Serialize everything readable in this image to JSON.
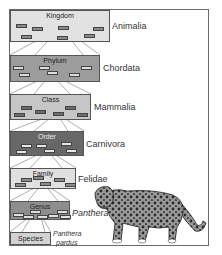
{
  "diagram": {
    "levels": [
      {
        "rank": "Kingdom",
        "taxon": "Animalia",
        "fill": "#e2e2e2",
        "chip": "#8a8a8a"
      },
      {
        "rank": "Phylum",
        "taxon": "Chordata",
        "fill": "#9c9c9c",
        "chip": "#dcdcdc"
      },
      {
        "rank": "Class",
        "taxon": "Mammalia",
        "fill": "#c6c6c6",
        "chip": "#6c6c6c"
      },
      {
        "rank": "Order",
        "taxon": "Carnivora",
        "fill": "#686868",
        "chip": "#e6e6e6"
      },
      {
        "rank": "Family",
        "taxon": "Felidae",
        "fill": "#e0e0e0",
        "chip": "#8c8c8c"
      },
      {
        "rank": "Genus",
        "taxon": "Panthera",
        "fill": "#8e8e8e",
        "chip": "#e0e0e0"
      },
      {
        "rank": "Species",
        "taxon_line1": "Panthera",
        "taxon_line2": "pardus",
        "fill": "#d2d2d2"
      }
    ],
    "illustration": "leopard"
  }
}
